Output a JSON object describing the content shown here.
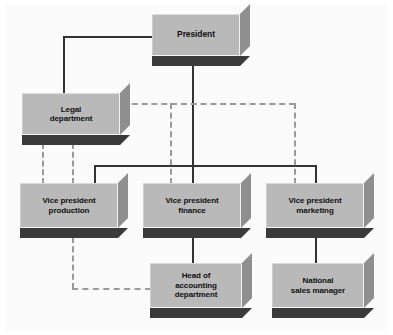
{
  "chart": {
    "type": "diagram",
    "style": {
      "background": "#ffffff",
      "box_face": "#b9b9b9",
      "box_side": "#8f8f8f",
      "box_shadow": "#3a3a3a",
      "solid_line": "#333333",
      "dashed_line": "#9a9a9a",
      "text": "#101010"
    },
    "nodes": [
      {
        "id": "president",
        "label": "President",
        "level": 0,
        "x": 152,
        "y": 14,
        "w": 88,
        "h": 42
      },
      {
        "id": "legal",
        "label": "Legal\ndepartment",
        "level": 1,
        "x": 22,
        "y": 93,
        "w": 98,
        "h": 42
      },
      {
        "id": "vp_prod",
        "label": "Vice president\nproduction",
        "level": 2,
        "x": 20,
        "y": 183,
        "w": 98,
        "h": 45
      },
      {
        "id": "vp_fin",
        "label": "Vice president\nfinance",
        "level": 2,
        "x": 143,
        "y": 183,
        "w": 98,
        "h": 45
      },
      {
        "id": "vp_mkt",
        "label": "Vice president\nmarketing",
        "level": 2,
        "x": 266,
        "y": 183,
        "w": 98,
        "h": 45
      },
      {
        "id": "head_acct",
        "label": "Head of\naccounting\ndepartment",
        "level": 3,
        "x": 150,
        "y": 263,
        "w": 92,
        "h": 45
      },
      {
        "id": "nat_sales",
        "label": "National\nsales manager",
        "level": 3,
        "x": 272,
        "y": 263,
        "w": 92,
        "h": 45
      }
    ],
    "edges": [
      {
        "from": "president",
        "to": "legal",
        "style": "solid",
        "kind": "line-authority"
      },
      {
        "from": "president",
        "to": "vp_prod",
        "style": "solid",
        "kind": "line-authority"
      },
      {
        "from": "president",
        "to": "vp_fin",
        "style": "solid",
        "kind": "line-authority"
      },
      {
        "from": "president",
        "to": "vp_mkt",
        "style": "solid",
        "kind": "line-authority"
      },
      {
        "from": "vp_fin",
        "to": "head_acct",
        "style": "solid",
        "kind": "line-authority"
      },
      {
        "from": "vp_mkt",
        "to": "nat_sales",
        "style": "solid",
        "kind": "line-authority"
      },
      {
        "from": "legal",
        "to": "vp_prod",
        "style": "dashed",
        "kind": "staff-advisory"
      },
      {
        "from": "legal",
        "to": "vp_fin",
        "style": "dashed",
        "kind": "staff-advisory"
      },
      {
        "from": "legal",
        "to": "vp_mkt",
        "style": "dashed",
        "kind": "staff-advisory"
      },
      {
        "from": "vp_prod",
        "to": "head_acct",
        "style": "dashed",
        "kind": "staff-advisory"
      }
    ]
  }
}
